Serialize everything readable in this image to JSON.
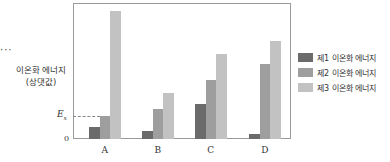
{
  "chart_data": {
    "type": "bar",
    "title": "",
    "xlabel": "",
    "ylabel": "이온화 에너지 (상댓값)",
    "ylabel_line1": "이온화 에너지",
    "ylabel_line2": "(상댓값)",
    "categories": [
      "A",
      "B",
      "C",
      "D"
    ],
    "series": [
      {
        "name": "제1 이온화 에너지",
        "color": "#6b6b6b",
        "values": [
          12,
          8,
          35,
          5
        ]
      },
      {
        "name": "제2 이온화 에너지",
        "color": "#9e9e9e",
        "values": [
          23,
          30,
          59,
          75
        ]
      },
      {
        "name": "제3 이온화 에너지",
        "color": "#c2c2c2",
        "values": [
          128,
          46,
          85,
          98
        ]
      }
    ],
    "ylim": [
      0,
      136
    ],
    "y_ticks": [
      "0",
      "Ex"
    ],
    "reference_line": {
      "label": "Ex",
      "value": 23,
      "style": "dashed"
    },
    "grid": false,
    "legend_position": "right"
  },
  "ui": {
    "ellipsis": "···",
    "zero_label": "0",
    "ex_label_main": "E",
    "ex_label_sub": "x"
  }
}
